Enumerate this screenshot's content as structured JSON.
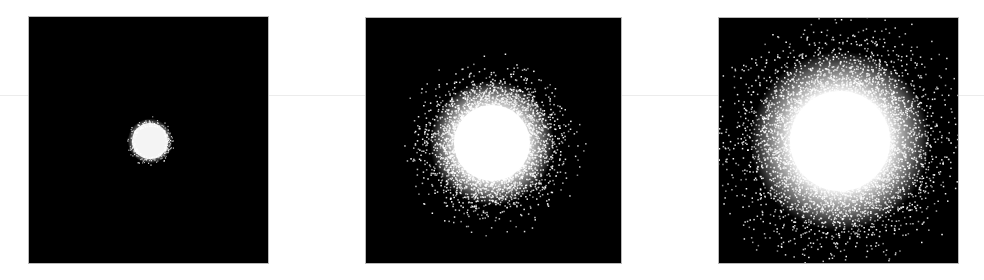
{
  "figure": {
    "background": "#ffffff",
    "panel_background": "#000000",
    "particle_color": "#ffffff",
    "hairline_y": 95,
    "panels": [
      {
        "id": "panel-1",
        "x": 29,
        "y": 17,
        "w": 239,
        "h": 246,
        "center": [
          121,
          124
        ],
        "core_radius": 18,
        "spread_sigma": 4,
        "scatter_count": 260,
        "scatter_max": 25,
        "label": "small-cluster"
      },
      {
        "id": "panel-2",
        "x": 366,
        "y": 18,
        "w": 255,
        "h": 245,
        "center": [
          126,
          125
        ],
        "core_radius": 38,
        "spread_sigma": 22,
        "scatter_count": 2600,
        "scatter_max": 95,
        "label": "medium-cluster"
      },
      {
        "id": "panel-3",
        "x": 719,
        "y": 18,
        "w": 239,
        "h": 245,
        "center": [
          121,
          123
        ],
        "core_radius": 50,
        "spread_sigma": 36,
        "scatter_count": 4200,
        "scatter_max": 140,
        "label": "large-cluster"
      }
    ]
  }
}
